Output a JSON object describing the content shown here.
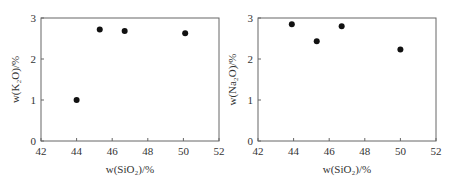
{
  "chart_data": [
    {
      "type": "scatter",
      "title": "",
      "xlabel": "w(SiO2)/%",
      "ylabel": "w(K2O)/%",
      "xlim": [
        42,
        52
      ],
      "ylim": [
        0,
        3
      ],
      "xticks": [
        "42",
        "44",
        "46",
        "48",
        "50",
        "52"
      ],
      "yticks": [
        "0",
        "1",
        "2",
        "3"
      ],
      "grid": false,
      "x": [
        44.0,
        45.3,
        46.7,
        50.1
      ],
      "y": [
        1.0,
        2.72,
        2.68,
        2.63
      ]
    },
    {
      "type": "scatter",
      "title": "",
      "xlabel": "w(SiO2)/%",
      "ylabel": "w(Na2O)/%",
      "xlim": [
        42,
        52
      ],
      "ylim": [
        0,
        3
      ],
      "xticks": [
        "42",
        "44",
        "46",
        "48",
        "50",
        "52"
      ],
      "yticks": [
        "0",
        "1",
        "2",
        "3"
      ],
      "grid": false,
      "x": [
        43.9,
        45.3,
        46.7,
        50.0
      ],
      "y": [
        2.85,
        2.43,
        2.8,
        2.23
      ]
    }
  ],
  "labels": {
    "left_x": "w(SiO₂)/%",
    "left_y": "w(K₂O)/%",
    "right_x": "w(SiO₂)/%",
    "right_y": "w(Na₂O)/%"
  }
}
